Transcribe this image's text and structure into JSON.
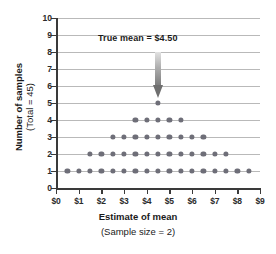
{
  "chart_data": {
    "type": "scatter",
    "title": "",
    "xlabel": "Estimate of mean",
    "xsublabel": "(Sample size = 2)",
    "ylabel": "Number of samples",
    "ysublabel": "(Total = 45)",
    "xlim": [
      0,
      9
    ],
    "ylim": [
      0,
      10
    ],
    "grid": true,
    "legend": null,
    "x_tick_labels": [
      "$0",
      "$1",
      "$2",
      "$3",
      "$4",
      "$5",
      "$6",
      "$7",
      "$8",
      "$9"
    ],
    "x_tick_values": [
      0,
      1,
      2,
      3,
      4,
      5,
      6,
      7,
      8,
      9
    ],
    "y_tick_labels": [
      "0",
      "1",
      "2",
      "3",
      "4",
      "5",
      "6",
      "7",
      "8",
      "9",
      "10"
    ],
    "y_tick_values": [
      0,
      1,
      2,
      3,
      4,
      5,
      6,
      7,
      8,
      9,
      10
    ],
    "dot_color": "#6e6e78",
    "gridline_color": "#b9b9b9",
    "axis_color": "#3a3a3a",
    "total_samples": 45,
    "stacks": [
      {
        "x": 0.5,
        "count": 1
      },
      {
        "x": 1.0,
        "count": 1
      },
      {
        "x": 1.5,
        "count": 2
      },
      {
        "x": 2.0,
        "count": 2
      },
      {
        "x": 2.5,
        "count": 3
      },
      {
        "x": 3.0,
        "count": 3
      },
      {
        "x": 3.5,
        "count": 4
      },
      {
        "x": 4.0,
        "count": 4
      },
      {
        "x": 4.5,
        "count": 5
      },
      {
        "x": 5.0,
        "count": 4
      },
      {
        "x": 5.5,
        "count": 4
      },
      {
        "x": 6.0,
        "count": 3
      },
      {
        "x": 6.5,
        "count": 3
      },
      {
        "x": 7.0,
        "count": 2
      },
      {
        "x": 7.5,
        "count": 2
      },
      {
        "x": 8.0,
        "count": 1
      },
      {
        "x": 8.5,
        "count": 1
      }
    ],
    "points": [
      {
        "x": 0.5,
        "y": 1
      },
      {
        "x": 1.0,
        "y": 1
      },
      {
        "x": 1.5,
        "y": 1
      },
      {
        "x": 2.0,
        "y": 1
      },
      {
        "x": 2.5,
        "y": 1
      },
      {
        "x": 3.0,
        "y": 1
      },
      {
        "x": 3.5,
        "y": 1
      },
      {
        "x": 4.0,
        "y": 1
      },
      {
        "x": 4.5,
        "y": 1
      },
      {
        "x": 5.0,
        "y": 1
      },
      {
        "x": 5.5,
        "y": 1
      },
      {
        "x": 6.0,
        "y": 1
      },
      {
        "x": 6.5,
        "y": 1
      },
      {
        "x": 7.0,
        "y": 1
      },
      {
        "x": 7.5,
        "y": 1
      },
      {
        "x": 8.0,
        "y": 1
      },
      {
        "x": 8.5,
        "y": 1
      },
      {
        "x": 1.5,
        "y": 2
      },
      {
        "x": 2.0,
        "y": 2
      },
      {
        "x": 2.5,
        "y": 2
      },
      {
        "x": 3.0,
        "y": 2
      },
      {
        "x": 3.5,
        "y": 2
      },
      {
        "x": 4.0,
        "y": 2
      },
      {
        "x": 4.5,
        "y": 2
      },
      {
        "x": 5.0,
        "y": 2
      },
      {
        "x": 5.5,
        "y": 2
      },
      {
        "x": 6.0,
        "y": 2
      },
      {
        "x": 6.5,
        "y": 2
      },
      {
        "x": 7.0,
        "y": 2
      },
      {
        "x": 7.5,
        "y": 2
      },
      {
        "x": 2.5,
        "y": 3
      },
      {
        "x": 3.0,
        "y": 3
      },
      {
        "x": 3.5,
        "y": 3
      },
      {
        "x": 4.0,
        "y": 3
      },
      {
        "x": 4.5,
        "y": 3
      },
      {
        "x": 5.0,
        "y": 3
      },
      {
        "x": 5.5,
        "y": 3
      },
      {
        "x": 6.0,
        "y": 3
      },
      {
        "x": 6.5,
        "y": 3
      },
      {
        "x": 3.5,
        "y": 4
      },
      {
        "x": 4.0,
        "y": 4
      },
      {
        "x": 4.5,
        "y": 4
      },
      {
        "x": 5.0,
        "y": 4
      },
      {
        "x": 5.5,
        "y": 4
      },
      {
        "x": 4.5,
        "y": 5
      }
    ],
    "annotation": {
      "text": "True mean  =  $4.50",
      "value": 4.5,
      "arrow_from_y": 8,
      "arrow_to_y": 5.3
    }
  }
}
